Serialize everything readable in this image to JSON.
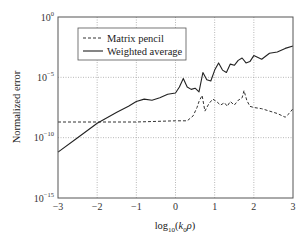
{
  "chart_data": {
    "type": "line",
    "title": "",
    "xlabel": "log10(k0 ρ)",
    "xlabel_parts": {
      "base": "log",
      "sub": "10",
      "arg_open": "(",
      "k": "k",
      "k_sub": "0",
      "rho": "ρ",
      "arg_close": ")"
    },
    "ylabel": "Normalized error",
    "yscale": "log",
    "xlim": [
      -3,
      3
    ],
    "ylim_exponents": [
      -15,
      0
    ],
    "grid": true,
    "grid_style": "dotted",
    "legend_position": "upper left",
    "x_ticks": [
      "-3",
      "-2",
      "-1",
      "0",
      "1",
      "2",
      "3"
    ],
    "y_ticks": [
      {
        "base": "10",
        "exp": "0"
      },
      {
        "base": "10",
        "exp": "-5"
      },
      {
        "base": "10",
        "exp": "-10"
      },
      {
        "base": "10",
        "exp": "-15"
      }
    ],
    "series": [
      {
        "name": "Matrix pencil",
        "style": "dashed",
        "color": "#333333",
        "x": [
          -3,
          -2,
          -1,
          0.0,
          0.3,
          0.45,
          0.55,
          0.6,
          0.68,
          0.75,
          0.85,
          0.95,
          1.05,
          1.15,
          1.25,
          1.32,
          1.4,
          1.5,
          1.6,
          1.7,
          1.75,
          1.82,
          1.9,
          2.0,
          2.2,
          2.4,
          2.6,
          2.8,
          2.9,
          3.0
        ],
        "log10_y": [
          -8.7,
          -8.7,
          -8.7,
          -8.6,
          -8.6,
          -8.2,
          -7.5,
          -7.0,
          -6.5,
          -7.8,
          -7.2,
          -6.8,
          -7.0,
          -7.3,
          -7.1,
          -7.4,
          -7.0,
          -7.3,
          -6.9,
          -6.7,
          -6.1,
          -6.9,
          -7.4,
          -7.5,
          -7.6,
          -7.8,
          -8.0,
          -8.3,
          -8.0,
          -7.6
        ]
      },
      {
        "name": "Weighted average",
        "style": "solid",
        "color": "#222222",
        "x": [
          -3,
          -2.5,
          -2,
          -1.5,
          -1.2,
          -1.0,
          -0.8,
          -0.6,
          -0.4,
          -0.2,
          0.0,
          0.1,
          0.2,
          0.3,
          0.4,
          0.5,
          0.6,
          0.7,
          0.8,
          0.9,
          1.0,
          1.1,
          1.2,
          1.3,
          1.4,
          1.5,
          1.6,
          1.7,
          1.8,
          1.9,
          2.0,
          2.2,
          2.4,
          2.6,
          2.8,
          3.0
        ],
        "log10_y": [
          -11.2,
          -10.0,
          -8.8,
          -7.9,
          -7.4,
          -7.0,
          -6.8,
          -6.9,
          -6.7,
          -6.4,
          -6.3,
          -5.8,
          -5.1,
          -5.8,
          -6.0,
          -5.9,
          -6.2,
          -4.6,
          -5.2,
          -5.3,
          -4.4,
          -3.8,
          -4.4,
          -4.6,
          -3.9,
          -4.0,
          -3.6,
          -3.4,
          -3.8,
          -3.7,
          -3.2,
          -3.5,
          -3.0,
          -2.9,
          -2.6,
          -2.4
        ]
      }
    ]
  },
  "legend": {
    "items": [
      {
        "label": "Matrix pencil",
        "style": "dashed"
      },
      {
        "label": "Weighted average",
        "style": "solid"
      }
    ]
  }
}
